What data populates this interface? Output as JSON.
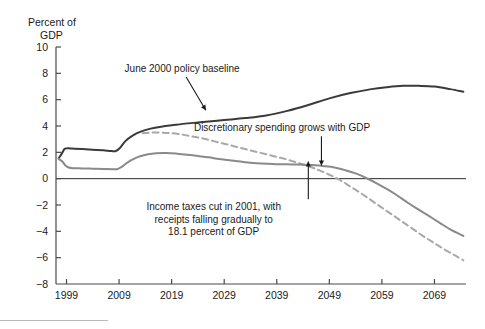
{
  "chart_data": {
    "type": "line",
    "title": "",
    "ylabel": "Percent of GDP",
    "ylabel_lines": [
      "Percent of",
      "GDP"
    ],
    "xlabel": "",
    "ylim": [
      -8,
      10
    ],
    "xlim": [
      1997,
      2075
    ],
    "yticks": [
      10,
      8,
      6,
      4,
      2,
      0,
      -2,
      -4,
      -6,
      -8
    ],
    "ytick_labels": [
      "10",
      "8",
      "6",
      "4",
      "2",
      "0",
      "−2",
      "−4",
      "−6",
      "−8"
    ],
    "xticks": [
      1999,
      2009,
      2019,
      2029,
      2039,
      2049,
      2059,
      2069
    ],
    "xtick_labels": [
      "1999",
      "2009",
      "2019",
      "2029",
      "2039",
      "2049",
      "2059",
      "2069"
    ],
    "grid": false,
    "legend": "none",
    "zero_line": 0,
    "series": [
      {
        "name": "June 2000 policy baseline",
        "color": "#3a3a3a",
        "style": "solid",
        "width": 2.0,
        "x": [
          1997.5,
          1998.1,
          1998.6,
          1999.0,
          1999.6,
          2000.5,
          2002.0,
          2004.0,
          2006.0,
          2007.5,
          2008.4,
          2009.2,
          2010.2,
          2011.5,
          2013.0,
          2015.0,
          2017.0,
          2019.0,
          2022.0,
          2025.0,
          2029.0,
          2033.0,
          2037.0,
          2041.0,
          2045.0,
          2049.0,
          2053.0,
          2057.0,
          2060.0,
          2063.0,
          2066.0,
          2069.0,
          2072.0,
          2074.5
        ],
        "y": [
          1.55,
          1.9,
          2.25,
          2.3,
          2.3,
          2.28,
          2.25,
          2.2,
          2.15,
          2.1,
          2.1,
          2.35,
          2.85,
          3.25,
          3.55,
          3.8,
          3.95,
          4.05,
          4.2,
          4.3,
          4.45,
          4.6,
          4.8,
          5.15,
          5.6,
          6.1,
          6.5,
          6.8,
          6.95,
          7.05,
          7.05,
          7.0,
          6.8,
          6.6
        ]
      },
      {
        "name": "Discretionary spending grows with GDP",
        "color": "#a8a8a8",
        "style": "dashed",
        "width": 2.0,
        "x": [
          2013.5,
          2015.0,
          2017.0,
          2019.0,
          2021.0,
          2023.0,
          2025.0,
          2027.0,
          2029.0,
          2031.0,
          2033.0,
          2035.0,
          2037.0,
          2039.0,
          2041.0,
          2043.0,
          2045.0,
          2047.0,
          2049.0,
          2051.0,
          2053.0,
          2055.0,
          2057.0,
          2059.0,
          2061.0,
          2063.0,
          2065.0,
          2067.0,
          2069.0,
          2071.0,
          2073.0,
          2074.5
        ],
        "y": [
          3.45,
          3.5,
          3.5,
          3.45,
          3.35,
          3.2,
          3.05,
          2.85,
          2.65,
          2.45,
          2.25,
          2.05,
          1.85,
          1.65,
          1.45,
          1.2,
          0.95,
          0.65,
          0.3,
          -0.1,
          -0.6,
          -1.1,
          -1.65,
          -2.2,
          -2.75,
          -3.3,
          -3.85,
          -4.4,
          -4.9,
          -5.4,
          -5.85,
          -6.2
        ]
      },
      {
        "name": "Income taxes cut in 2001, with receipts falling gradually to 18.1 percent of GDP",
        "color": "#8a8a8a",
        "style": "solid",
        "width": 2.0,
        "x": [
          1997.5,
          1998.2,
          1998.8,
          1999.4,
          2000.2,
          2002.0,
          2004.0,
          2006.0,
          2007.8,
          2008.6,
          2009.5,
          2010.5,
          2011.8,
          2013.0,
          2014.5,
          2016.0,
          2018.0,
          2020.0,
          2022.0,
          2024.0,
          2026.0,
          2028.0,
          2030.0,
          2033.0,
          2036.0,
          2039.0,
          2042.0,
          2045.0,
          2048.0,
          2050.0,
          2052.0,
          2054.0,
          2056.0,
          2058.0,
          2060.0,
          2062.0,
          2064.0,
          2066.0,
          2068.0,
          2070.0,
          2072.0,
          2074.5
        ],
        "y": [
          1.5,
          1.3,
          1.0,
          0.85,
          0.8,
          0.78,
          0.76,
          0.74,
          0.72,
          0.72,
          0.9,
          1.2,
          1.5,
          1.7,
          1.85,
          1.93,
          1.95,
          1.9,
          1.82,
          1.72,
          1.62,
          1.5,
          1.4,
          1.25,
          1.15,
          1.1,
          1.08,
          1.05,
          0.95,
          0.85,
          0.65,
          0.4,
          0.05,
          -0.35,
          -0.8,
          -1.3,
          -1.85,
          -2.35,
          -2.85,
          -3.35,
          -3.85,
          -4.35
        ]
      }
    ],
    "annotations": [
      {
        "id": "baseline-annotation",
        "lines": [
          "June 2000 policy baseline"
        ],
        "text": "June 2000 policy baseline",
        "x": 2021.0,
        "y": 8.1,
        "arrow_to_x": 2025.5,
        "arrow_to_y": 5.2
      },
      {
        "id": "discretionary-annotation",
        "lines": [
          "Discretionary spending grows with GDP"
        ],
        "text": "Discretionary spending grows with GDP",
        "x": 2040.0,
        "y": 3.6,
        "arrow_to_x": 2047.5,
        "arrow_to_y": 1.0
      },
      {
        "id": "taxcut-annotation",
        "lines": [
          "Income taxes cut in 2001, with",
          "receipts falling gradually to",
          "18.1 percent of GDP"
        ],
        "text": "Income taxes cut in 2001, with receipts falling gradually to 18.1 percent of GDP",
        "x": 2027.0,
        "y": -2.4,
        "arrow_to_x": 2045.0,
        "arrow_to_y": 1.3
      }
    ]
  }
}
